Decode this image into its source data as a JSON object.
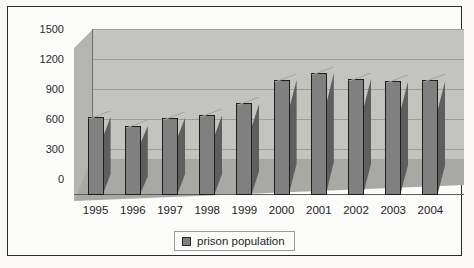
{
  "chart_data": {
    "type": "bar",
    "title": "",
    "subtitle": "",
    "xlabel": "",
    "ylabel": "",
    "categories": [
      "1995",
      "1996",
      "1997",
      "1998",
      "1999",
      "2000",
      "2001",
      "2002",
      "2003",
      "2004"
    ],
    "series": [
      {
        "name": "prison population",
        "values": [
          780,
          690,
          770,
          800,
          920,
          1150,
          1220,
          1160,
          1140,
          1150
        ],
        "color": "#808080"
      }
    ],
    "ylim": [
      0,
      1500
    ],
    "yticks": [
      0,
      300,
      600,
      900,
      1200,
      1500
    ],
    "ytick_labels": [
      "0",
      "300",
      "600",
      "900",
      "1200",
      "1500"
    ],
    "grid": true,
    "grid_axis": "y",
    "legend": {
      "position": "bottom",
      "entries": [
        {
          "label": "prison population",
          "color": "#808080"
        }
      ]
    },
    "style": {
      "three_d": true,
      "plot_background": "#c3c3c0",
      "floor_color": "#a8a8a5",
      "bar_front": "#808080",
      "bar_side": "#5e5e5e",
      "bar_top": "#a5a5a3",
      "gridline_color": "#9c9c99",
      "frame_color": "#2b2b2b"
    }
  }
}
